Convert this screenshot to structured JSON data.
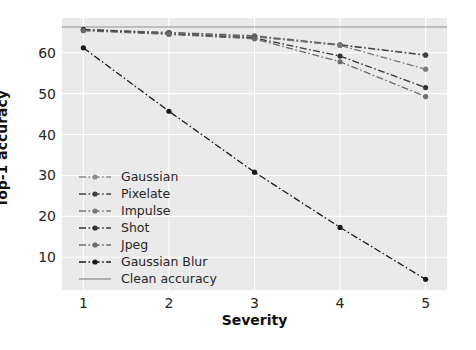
{
  "chart_data": {
    "type": "line",
    "title": "",
    "xlabel": "Severity",
    "ylabel": "Top-1 accuracy",
    "x": [
      1,
      2,
      3,
      4,
      5
    ],
    "xticks": [
      "1",
      "2",
      "3",
      "4",
      "5"
    ],
    "yticks": [
      "10",
      "20",
      "30",
      "40",
      "50",
      "60"
    ],
    "ytickvals": [
      10,
      20,
      30,
      40,
      50,
      60
    ],
    "xlim": [
      0.75,
      5.25
    ],
    "ylim": [
      2.0,
      68.5
    ],
    "grid": true,
    "grid_color": "#ffffff",
    "axes_facecolor": "#eaeaea",
    "legend_position": "center-left",
    "series": [
      {
        "name": "Gaussian",
        "values": [
          65.6,
          65.0,
          64.2,
          62.0,
          59.5
        ],
        "color": "#8c8c8c",
        "marker": "circle",
        "linestyle": "dashdot"
      },
      {
        "name": "Pixelate",
        "values": [
          65.7,
          64.9,
          64.0,
          61.9,
          59.4
        ],
        "color": "#404040",
        "marker": "circle",
        "linestyle": "dashdot"
      },
      {
        "name": "Impulse",
        "values": [
          65.5,
          64.8,
          63.9,
          61.8,
          56.0
        ],
        "color": "#787878",
        "marker": "circle",
        "linestyle": "dashdot"
      },
      {
        "name": "Shot",
        "values": [
          65.6,
          64.6,
          63.6,
          59.2,
          51.5
        ],
        "color": "#333333",
        "marker": "circle",
        "linestyle": "dashdot"
      },
      {
        "name": "Jpeg",
        "values": [
          65.4,
          64.5,
          63.4,
          57.8,
          49.3
        ],
        "color": "#6b6b6b",
        "marker": "circle",
        "linestyle": "dashdot"
      },
      {
        "name": "Gaussian Blur",
        "values": [
          61.2,
          45.7,
          30.8,
          17.3,
          4.6
        ],
        "color": "#1a1a1a",
        "marker": "circle",
        "linestyle": "dashdot"
      }
    ],
    "hlines": [
      {
        "name": "Clean accuracy",
        "value": 66.3,
        "color": "#8f8f8f",
        "linestyle": "solid"
      }
    ]
  }
}
